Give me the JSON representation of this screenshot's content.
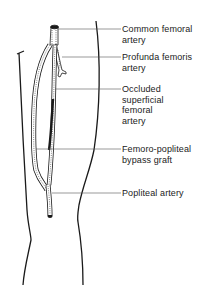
{
  "diagram": {
    "labels": [
      {
        "id": "common-femoral",
        "text": "Common  femoral\nartery",
        "top": 24
      },
      {
        "id": "profunda-femoris",
        "text": "Profunda  femoris\nartery",
        "top": 52
      },
      {
        "id": "occluded-sfa",
        "text": "Occluded\nsuperficial\nfemoral\nartery",
        "top": 84
      },
      {
        "id": "bypass-graft",
        "text": "Femoro-popliteal\nbypass graft",
        "top": 144
      },
      {
        "id": "popliteal",
        "text": "Popliteal artery",
        "top": 188
      }
    ],
    "colors": {
      "line": "#1a1a1a",
      "leader": "#555555",
      "background": "#ffffff"
    }
  }
}
